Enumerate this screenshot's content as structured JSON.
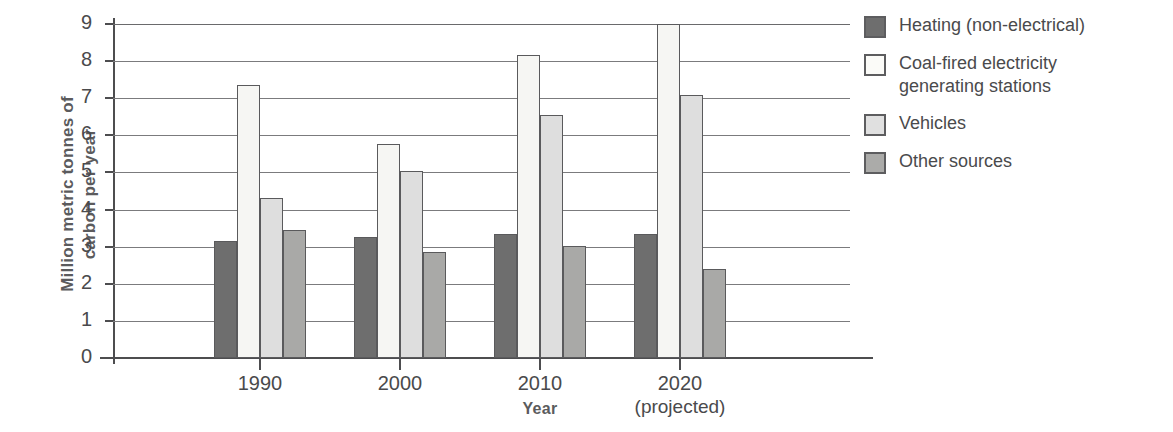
{
  "chart_data": {
    "type": "bar",
    "title": "",
    "xlabel": "Year",
    "ylabel": "Million metric tonnes of\ncarbon per year",
    "categories": [
      "1990",
      "2000",
      "2010",
      "2020"
    ],
    "category_sublabels": [
      "",
      "",
      "",
      "(projected)"
    ],
    "ylim": [
      0,
      9
    ],
    "yticks": [
      0,
      1,
      2,
      3,
      4,
      5,
      6,
      7,
      8,
      9
    ],
    "ytick_labels": [
      "0",
      "1",
      "2",
      "3",
      "4",
      "5",
      "6",
      "7",
      "8",
      "9"
    ],
    "grid": true,
    "grid_axis": "y",
    "legend_position": "right",
    "series": [
      {
        "name": "Heating (non-electrical)",
        "color": "#6e6e6e",
        "values": [
          3.15,
          3.27,
          3.33,
          3.34
        ]
      },
      {
        "name": "Coal-fired electricity\ngenerating stations",
        "color": "#f6f6f3",
        "values": [
          7.36,
          5.78,
          8.17,
          9.0
        ]
      },
      {
        "name": "Vehicles",
        "color": "#dedede",
        "values": [
          4.3,
          5.05,
          6.55,
          7.08
        ]
      },
      {
        "name": "Other sources",
        "color": "#a9a9a7",
        "values": [
          3.45,
          2.85,
          3.03,
          2.4
        ]
      }
    ]
  },
  "axis": {
    "y_title": "Million metric tonnes of\ncarbon per year",
    "x_title": "Year"
  },
  "legend": {
    "items": [
      {
        "label": "Heating (non-electrical)",
        "swatch": "dark-gray"
      },
      {
        "label": "Coal-fired electricity\ngenerating stations",
        "swatch": "white"
      },
      {
        "label": "Vehicles",
        "swatch": "light-gray"
      },
      {
        "label": "Other sources",
        "swatch": "medium-gray"
      }
    ]
  }
}
